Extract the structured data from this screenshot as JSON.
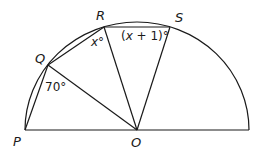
{
  "diagram": {
    "type": "semicircle-geometry",
    "points": {
      "P": {
        "label": "P",
        "x": 25,
        "y": 130
      },
      "Q": {
        "label": "Q",
        "x": 48,
        "y": 65
      },
      "R": {
        "label": "R",
        "x": 104,
        "y": 27
      },
      "S": {
        "label": "S",
        "x": 170,
        "y": 27
      },
      "O": {
        "label": "O",
        "x": 137,
        "y": 130
      }
    },
    "angles": {
      "PQO": "70°",
      "QRO": "x°",
      "ORS_prefix": "(",
      "ORS_var": "x",
      "ORS_suffix": " + 1)°"
    },
    "colors": {
      "stroke": "#1a1a1a",
      "background": "#ffffff"
    }
  }
}
